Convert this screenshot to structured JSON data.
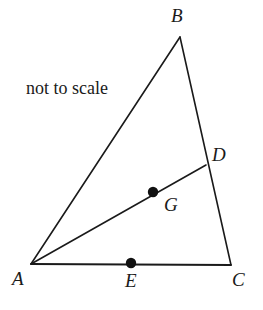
{
  "figure": {
    "note": "not to scale",
    "stroke_color": "#1a1a1a",
    "dot_color": "#111111",
    "background_color": "#ffffff",
    "vertices": {
      "A": {
        "label": "A",
        "x": 31,
        "y": 264
      },
      "B": {
        "label": "B",
        "x": 180,
        "y": 37
      },
      "C": {
        "label": "C",
        "x": 231,
        "y": 265
      }
    },
    "points": {
      "D": {
        "label": "D",
        "x": 206,
        "y": 165,
        "on_segment": "BC",
        "marked": false
      },
      "G": {
        "label": "G",
        "x": 153,
        "y": 192,
        "on_segment": "AD",
        "marked": true
      },
      "E": {
        "label": "E",
        "x": 131,
        "y": 263,
        "on_segment": "AC",
        "marked": true
      }
    },
    "segments": [
      {
        "name": "AB",
        "from": "A",
        "to": "B"
      },
      {
        "name": "BC",
        "from": "B",
        "to": "C"
      },
      {
        "name": "AC",
        "from": "A",
        "to": "C"
      },
      {
        "name": "AD",
        "from": "A",
        "to": "D"
      }
    ],
    "dot_radius": 5.2,
    "line_width": 1.6
  }
}
